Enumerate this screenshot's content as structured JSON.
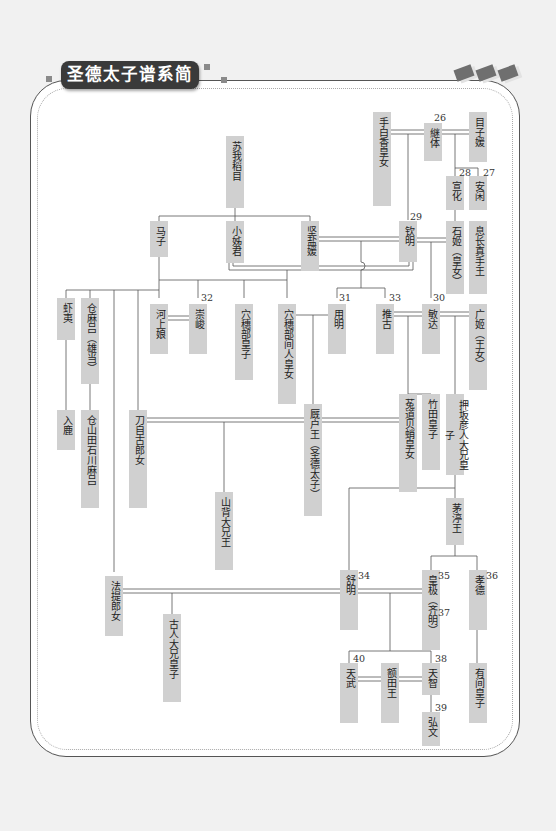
{
  "title": "圣德太子谱系简图",
  "colors": {
    "box_fill": "#d0d0d0",
    "line": "#555555",
    "title_bg": "#3a3a3a",
    "page_bg": "#f1f1f1"
  },
  "people": {
    "tedai": "手白香皇女",
    "keitai": "継体",
    "menoko": "目子媛",
    "senka": "宣化",
    "ankan": "安闲",
    "soga_iname": "苏我稻目",
    "koane": "小姊君",
    "kitashi": "坚盐媛",
    "kinmei": "钦明",
    "ishihime": "石姬（皇女）",
    "okinaga": "息长真手王",
    "umako": "马子",
    "emishi": "虾夷",
    "kurayamada_o": "仓麻吕（雄当）",
    "kawakami": "河上娘",
    "sushun": "崇峻",
    "anahobe_miko": "穴穗部皇子",
    "hashihito": "穴穗部间人皇女",
    "yomei": "用明",
    "suiko": "推古",
    "bidatsu": "敏达",
    "hiro": "广姬（王女）",
    "iruka": "入鹿",
    "kurayamada_ishikawa": "仓山田石川麻吕",
    "tojiko": "刀自古郎女",
    "umayado": "厩户王（圣德太子）",
    "uji": "菟道贝蛸皇女",
    "takeda": "竹田皇子",
    "oshisaka": "押坂彦人大兄皇子",
    "yamashiro": "山背大兄王",
    "chinu": "茅渟王",
    "hote": "法提郎女",
    "furuhito": "古人大兄皇子",
    "jomei": "舒明",
    "kogyoku": "皇极（齐明）",
    "kotoku": "孝德",
    "temmu": "天武",
    "nukata": "额田王",
    "tenji": "天智",
    "kobun": "弘文",
    "arima": "有间皇子"
  },
  "reign_numbers": {
    "keitai": "26",
    "ankan": "27",
    "senka": "28",
    "kinmei": "29",
    "bidatsu": "30",
    "yomei": "31",
    "sushun": "32",
    "suiko": "33",
    "jomei": "34",
    "kogyoku": "35",
    "kotoku": "36",
    "saimei": "37",
    "tenji": "38",
    "kobun": "39",
    "temmu": "40"
  }
}
